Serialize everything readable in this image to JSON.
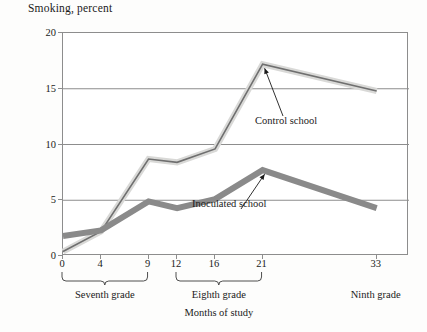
{
  "chart_data": {
    "type": "line",
    "title": "Smoking, percent",
    "xlabel": "Months of study",
    "ylabel": "Smoking, percent",
    "x": [
      0,
      4,
      9,
      12,
      16,
      21,
      33
    ],
    "xtick_labels": [
      "0",
      "4",
      "9",
      "12",
      "16",
      "21",
      "33"
    ],
    "ytick_labels": [
      "0",
      "5",
      "10",
      "15",
      "20"
    ],
    "yticks": [
      0,
      5,
      10,
      15,
      20
    ],
    "ylim": [
      0,
      20
    ],
    "grid": "horizontal",
    "legend": "inline-annotations",
    "series": [
      {
        "name": "Control school",
        "color": "#d9d9d7",
        "values": [
          0.4,
          2.2,
          8.7,
          8.4,
          9.6,
          17.2,
          14.8
        ]
      },
      {
        "name": "Inoculated school",
        "color": "#8a8a8a",
        "values": [
          1.8,
          2.3,
          4.9,
          4.3,
          5.1,
          7.7,
          4.3
        ]
      }
    ],
    "annotations": [
      {
        "text": "Control school",
        "points_to_x": 21,
        "points_to_y": 17.2
      },
      {
        "text": "Inoculated school",
        "points_to_x": 21,
        "points_to_y": 7.7
      }
    ],
    "groups": [
      {
        "label": "Seventh grade",
        "from_x": 0,
        "to_x": 9
      },
      {
        "label": "Eighth grade",
        "from_x": 12,
        "to_x": 21
      },
      {
        "label": "Ninth grade",
        "from_x": 33,
        "to_x": 33
      }
    ]
  }
}
